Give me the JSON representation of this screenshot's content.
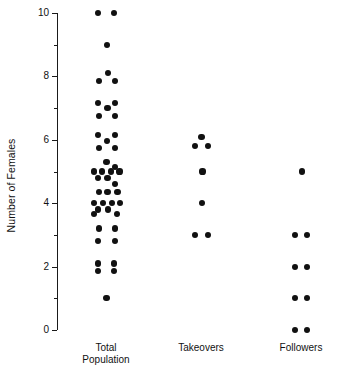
{
  "chart_data": {
    "type": "scatter",
    "title": "",
    "xlabel": "",
    "ylabel": "Number of Females",
    "ylim": [
      0,
      10
    ],
    "grid": false,
    "legend": null,
    "y_major_ticks": [
      0,
      2,
      4,
      6,
      8,
      10
    ],
    "y_minor_ticks": [
      1,
      3,
      5,
      7,
      9
    ],
    "y_tick_labels": [
      "0",
      "2",
      "4",
      "6",
      "8",
      "10"
    ],
    "categories": [
      "Total\nPopulation",
      "Takeovers",
      "Followers"
    ],
    "category_labels": [
      "Total Population",
      "Takeovers",
      "Followers"
    ],
    "note": "Dot-density (jittered strip) plot: each dot is one group; dots at the same count are spread horizontally.",
    "series": [
      {
        "name": "Total Population",
        "counts": [
          10,
          10,
          9,
          8,
          8,
          8,
          7,
          7,
          7,
          7,
          7,
          6,
          6,
          6,
          6,
          6,
          5,
          5,
          5,
          5,
          5,
          5,
          5,
          5,
          5,
          4,
          4,
          4,
          4,
          4,
          4,
          4,
          4,
          4,
          4,
          3,
          3,
          3,
          3,
          2,
          2,
          2,
          2,
          1
        ],
        "n": 44,
        "points": [
          {
            "value": 10.0,
            "jitter": -0.3
          },
          {
            "value": 10.0,
            "jitter": 0.3
          },
          {
            "value": 9.0,
            "jitter": 0.05
          },
          {
            "value": 8.1,
            "jitter": 0.08
          },
          {
            "value": 7.85,
            "jitter": -0.28
          },
          {
            "value": 7.85,
            "jitter": 0.34
          },
          {
            "value": 7.15,
            "jitter": -0.32
          },
          {
            "value": 7.15,
            "jitter": 0.36
          },
          {
            "value": 7.0,
            "jitter": 0.06
          },
          {
            "value": 6.75,
            "jitter": -0.28
          },
          {
            "value": 6.75,
            "jitter": 0.34
          },
          {
            "value": 6.15,
            "jitter": -0.3
          },
          {
            "value": 6.15,
            "jitter": 0.34
          },
          {
            "value": 5.95,
            "jitter": 0.05
          },
          {
            "value": 5.75,
            "jitter": -0.28
          },
          {
            "value": 5.75,
            "jitter": 0.34
          },
          {
            "value": 5.3,
            "jitter": 0.02
          },
          {
            "value": 5.15,
            "jitter": 0.34
          },
          {
            "value": 5.0,
            "jitter": -0.46
          },
          {
            "value": 5.0,
            "jitter": -0.14
          },
          {
            "value": 5.0,
            "jitter": 0.18
          },
          {
            "value": 5.0,
            "jitter": 0.52
          },
          {
            "value": 4.8,
            "jitter": -0.3
          },
          {
            "value": 4.8,
            "jitter": 0.06
          },
          {
            "value": 4.6,
            "jitter": 0.36
          },
          {
            "value": 4.35,
            "jitter": -0.28
          },
          {
            "value": 4.35,
            "jitter": 0.06
          },
          {
            "value": 4.35,
            "jitter": 0.44
          },
          {
            "value": 4.0,
            "jitter": -0.46
          },
          {
            "value": 4.0,
            "jitter": -0.12
          },
          {
            "value": 4.0,
            "jitter": 0.22
          },
          {
            "value": 4.0,
            "jitter": 0.54
          },
          {
            "value": 3.8,
            "jitter": -0.3
          },
          {
            "value": 3.8,
            "jitter": 0.08
          },
          {
            "value": 3.65,
            "jitter": -0.46
          },
          {
            "value": 3.65,
            "jitter": 0.42
          },
          {
            "value": 3.2,
            "jitter": -0.28
          },
          {
            "value": 3.2,
            "jitter": 0.34
          },
          {
            "value": 2.8,
            "jitter": -0.3
          },
          {
            "value": 2.8,
            "jitter": 0.34
          },
          {
            "value": 2.1,
            "jitter": -0.3
          },
          {
            "value": 2.1,
            "jitter": 0.32
          },
          {
            "value": 1.85,
            "jitter": -0.3
          },
          {
            "value": 1.85,
            "jitter": 0.32
          },
          {
            "value": 1.0,
            "jitter": 0.02
          }
        ]
      },
      {
        "name": "Takeovers",
        "counts": [
          6,
          6,
          6,
          5,
          4,
          3,
          3
        ],
        "n": 7,
        "points": [
          {
            "value": 6.1,
            "jitter": 0.02
          },
          {
            "value": 5.8,
            "jitter": -0.22
          },
          {
            "value": 5.8,
            "jitter": 0.26
          },
          {
            "value": 5.0,
            "jitter": 0.06
          },
          {
            "value": 4.0,
            "jitter": 0.04
          },
          {
            "value": 3.0,
            "jitter": -0.22
          },
          {
            "value": 3.0,
            "jitter": 0.26
          }
        ]
      },
      {
        "name": "Followers",
        "counts": [
          5,
          3,
          3,
          2,
          2,
          1,
          1,
          0,
          0
        ],
        "n": 9,
        "points": [
          {
            "value": 5.0,
            "jitter": 0.04
          },
          {
            "value": 3.0,
            "jitter": -0.22
          },
          {
            "value": 3.0,
            "jitter": 0.24
          },
          {
            "value": 2.0,
            "jitter": -0.22
          },
          {
            "value": 2.0,
            "jitter": 0.24
          },
          {
            "value": 1.0,
            "jitter": -0.22
          },
          {
            "value": 1.0,
            "jitter": 0.24
          },
          {
            "value": 0.0,
            "jitter": -0.22
          },
          {
            "value": 0.0,
            "jitter": 0.24
          }
        ]
      }
    ]
  },
  "layout": {
    "plot_top_y": 13,
    "plot_bottom_y": 330,
    "axis_x": 57,
    "column_centers": [
      106,
      201,
      301
    ],
    "jitter_unit_px": 26,
    "dot_radius": 3.1,
    "tick_major_len": 5,
    "tick_minor_len": 3
  }
}
